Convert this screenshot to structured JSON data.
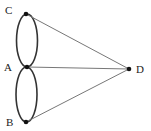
{
  "diagram": {
    "type": "graph",
    "colors": {
      "edge": "#333333",
      "line": "#777777",
      "node": "#111111",
      "label": "#222222",
      "background": "#ffffff"
    },
    "nodes": [
      {
        "id": "C",
        "label": "C",
        "x": 26,
        "y": 14,
        "label_x": 5,
        "label_y": 14
      },
      {
        "id": "A",
        "label": "A",
        "x": 27,
        "y": 67,
        "label_x": 4,
        "label_y": 71
      },
      {
        "id": "B",
        "label": "B",
        "x": 26,
        "y": 122,
        "label_x": 6,
        "label_y": 126
      },
      {
        "id": "D",
        "label": "D",
        "x": 129,
        "y": 69,
        "label_x": 136,
        "label_y": 73
      }
    ],
    "edges": [
      {
        "from": "C",
        "to": "A",
        "kind": "curved",
        "count": 2,
        "note": "two arcs forming an ellipse"
      },
      {
        "from": "A",
        "to": "B",
        "kind": "curved",
        "count": 2,
        "note": "two arcs forming an ellipse"
      },
      {
        "from": "C",
        "to": "D",
        "kind": "straight",
        "count": 1
      },
      {
        "from": "A",
        "to": "D",
        "kind": "straight",
        "count": 1
      },
      {
        "from": "B",
        "to": "D",
        "kind": "straight",
        "count": 1
      }
    ]
  }
}
